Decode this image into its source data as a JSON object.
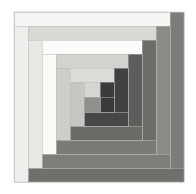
{
  "artwork": {
    "title": "Log Cabin Quilt Block",
    "pattern_type": "log-cabin-spiral",
    "canvas": {
      "width": 196,
      "height": 194,
      "background": "#ffffff"
    },
    "block_bounds": {
      "x": 14,
      "y": 12,
      "width": 170,
      "height": 170
    },
    "winding": "clockwise-inward",
    "value_scheme": {
      "light_side": "top-left",
      "dark_side": "bottom-right"
    },
    "stroke": {
      "color": "#b8b8b8",
      "width": 0.5
    },
    "palette": {
      "white": "#fbfbfa",
      "near_white": "#f4f3f1",
      "pale": "#ededea",
      "light_gray": "#e2e2df",
      "light_gray_2": "#d9d9d5",
      "silver": "#cfcfcb",
      "mid_light": "#c2c2bd",
      "mid": "#b2b2ad",
      "mid_gray": "#a3a39e",
      "slate": "#8e8e8a",
      "dark_slate": "#7c7c79",
      "charcoal": "#6b6b68",
      "dark": "#5c5c5a",
      "darker": "#4d4d4c",
      "darkest": "#3e3e3e",
      "near_black": "#343434"
    },
    "strips": [
      {
        "id": "s01",
        "name": "outer-top-light",
        "x": 14,
        "y": 12,
        "w": 156,
        "h": 14,
        "fill": "#f6f5f3",
        "value": "light"
      },
      {
        "id": "s02",
        "name": "outer-right-dark",
        "x": 170,
        "y": 12,
        "w": 14,
        "h": 156,
        "fill": "#7c7c79",
        "value": "dark"
      },
      {
        "id": "s03",
        "name": "outer-bottom-dark",
        "x": 28,
        "y": 168,
        "w": 156,
        "h": 14,
        "fill": "#6f6f6c",
        "value": "dark"
      },
      {
        "id": "s04",
        "name": "outer-left-light",
        "x": 14,
        "y": 26,
        "w": 14,
        "h": 156,
        "fill": "#eeeeec",
        "value": "light"
      },
      {
        "id": "s05",
        "name": "ring2-top-light",
        "x": 28,
        "y": 26,
        "w": 128,
        "h": 14,
        "fill": "#d8d8d4",
        "value": "light"
      },
      {
        "id": "s06",
        "name": "ring2-right-dark",
        "x": 156,
        "y": 26,
        "w": 14,
        "h": 128,
        "fill": "#8b8b87",
        "value": "dark"
      },
      {
        "id": "s07",
        "name": "ring2-bottom-dark",
        "x": 42,
        "y": 154,
        "w": 128,
        "h": 14,
        "fill": "#7d7d7a",
        "value": "dark"
      },
      {
        "id": "s08",
        "name": "ring2-left-light",
        "x": 28,
        "y": 40,
        "w": 14,
        "h": 128,
        "fill": "#e7e7e4",
        "value": "light"
      },
      {
        "id": "s09",
        "name": "ring3-top-white",
        "x": 42,
        "y": 40,
        "w": 100,
        "h": 14,
        "fill": "#fbfbfa",
        "value": "light"
      },
      {
        "id": "s10",
        "name": "ring3-right-dark",
        "x": 142,
        "y": 40,
        "w": 14,
        "h": 100,
        "fill": "#6c6c69",
        "value": "dark"
      },
      {
        "id": "s11",
        "name": "ring3-bottom-dark",
        "x": 56,
        "y": 140,
        "w": 100,
        "h": 14,
        "fill": "#7a7a77",
        "value": "dark"
      },
      {
        "id": "s12",
        "name": "ring3-left-white",
        "x": 42,
        "y": 54,
        "w": 14,
        "h": 100,
        "fill": "#fafaf8",
        "value": "light"
      },
      {
        "id": "s13",
        "name": "ring4-top-pale",
        "x": 56,
        "y": 54,
        "w": 72,
        "h": 14,
        "fill": "#d2d2ce",
        "value": "light"
      },
      {
        "id": "s14",
        "name": "ring4-right-dark",
        "x": 128,
        "y": 54,
        "w": 14,
        "h": 72,
        "fill": "#5d5d5b",
        "value": "dark"
      },
      {
        "id": "s15",
        "name": "ring4-bottom-dark",
        "x": 70,
        "y": 126,
        "w": 72,
        "h": 14,
        "fill": "#6a6a67",
        "value": "dark"
      },
      {
        "id": "s16",
        "name": "ring4-left-pale",
        "x": 56,
        "y": 68,
        "w": 14,
        "h": 72,
        "fill": "#cdcdc9",
        "value": "light"
      },
      {
        "id": "s17",
        "name": "ring5-top-light",
        "x": 70,
        "y": 68,
        "w": 44,
        "h": 14,
        "fill": "#dcdcd8",
        "value": "light"
      },
      {
        "id": "s18",
        "name": "ring5-right-dark",
        "x": 114,
        "y": 68,
        "w": 14,
        "h": 44,
        "fill": "#414141",
        "value": "dark"
      },
      {
        "id": "s19",
        "name": "ring5-bottom-dark",
        "x": 84,
        "y": 112,
        "w": 44,
        "h": 14,
        "fill": "#474747",
        "value": "dark"
      },
      {
        "id": "s20",
        "name": "ring5-left-light",
        "x": 70,
        "y": 82,
        "w": 14,
        "h": 44,
        "fill": "#c6c6c2",
        "value": "light"
      },
      {
        "id": "s21",
        "name": "ring6-top-light",
        "x": 84,
        "y": 82,
        "w": 16,
        "h": 15,
        "fill": "#d5d5d1",
        "value": "light"
      },
      {
        "id": "s22",
        "name": "ring6-right-dark",
        "x": 100,
        "y": 82,
        "w": 14,
        "h": 15,
        "fill": "#3b3b3b",
        "value": "dark"
      },
      {
        "id": "s23",
        "name": "ring6-bottom-dark",
        "x": 100,
        "y": 97,
        "w": 14,
        "h": 15,
        "fill": "#3a3a3a",
        "value": "dark"
      },
      {
        "id": "s24",
        "name": "center-square",
        "x": 84,
        "y": 97,
        "w": 16,
        "h": 15,
        "fill": "#8f8f8b",
        "value": "mid"
      }
    ]
  }
}
